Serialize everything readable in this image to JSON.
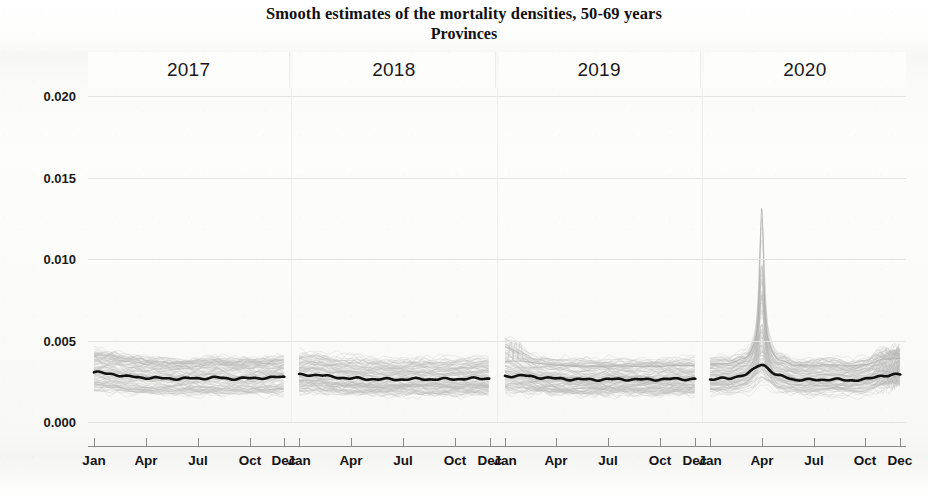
{
  "title": {
    "main": "Smooth estimates of the mortality densities, 50-69 years",
    "sub": "Provinces"
  },
  "chart_data": {
    "type": "line",
    "title": "Smooth estimates of the mortality densities, 50-69 years",
    "subtitle": "Provinces",
    "xlabel": "",
    "ylabel": "",
    "grid": true,
    "legend": false,
    "legend_position": "none",
    "faceted": true,
    "facet_labels": [
      "2017",
      "2018",
      "2019",
      "2020"
    ],
    "ylim": [
      0.0,
      0.0205
    ],
    "ytick_values": [
      0.0,
      0.005,
      0.01,
      0.015,
      0.02
    ],
    "ytick_labels": [
      "0.000",
      "0.005",
      "0.010",
      "0.015",
      "0.020"
    ],
    "xtick_labels": [
      "Jan",
      "Apr",
      "Jul",
      "Oct",
      "Dec"
    ],
    "xtick_months": [
      1,
      4,
      7,
      10,
      12
    ],
    "colors": {
      "mean_line": "#111111",
      "province_lines": "#b9b9b9",
      "gridline": "#e3e3e2",
      "axis": "#8b8b8b",
      "background": "#fbfbfa"
    },
    "series_description": "One faint grey curve per province plus a bold black overall mean curve, per calendar year panel.",
    "n_provinces": 107,
    "series": [
      {
        "name": "Mean (all provinces) 2017",
        "facet": "2017",
        "color": "#111111",
        "x": [
          1,
          2,
          3,
          4,
          5,
          6,
          7,
          8,
          9,
          10,
          11,
          12
        ],
        "values": [
          0.00305,
          0.00295,
          0.00278,
          0.00272,
          0.00268,
          0.00266,
          0.00268,
          0.00272,
          0.00266,
          0.00268,
          0.00272,
          0.00276
        ]
      },
      {
        "name": "Mean (all provinces) 2018",
        "facet": "2018",
        "color": "#111111",
        "x": [
          1,
          2,
          3,
          4,
          5,
          6,
          7,
          8,
          9,
          10,
          11,
          12
        ],
        "values": [
          0.00288,
          0.0029,
          0.00276,
          0.00268,
          0.00264,
          0.00262,
          0.00262,
          0.00264,
          0.00262,
          0.00264,
          0.00266,
          0.00268
        ]
      },
      {
        "name": "Mean (all provinces) 2019",
        "facet": "2019",
        "color": "#111111",
        "x": [
          1,
          2,
          3,
          4,
          5,
          6,
          7,
          8,
          9,
          10,
          11,
          12
        ],
        "values": [
          0.00282,
          0.00284,
          0.00274,
          0.00266,
          0.00262,
          0.0026,
          0.00262,
          0.00262,
          0.0026,
          0.00262,
          0.00264,
          0.00264
        ]
      },
      {
        "name": "Mean (all provinces) 2020",
        "facet": "2020",
        "color": "#111111",
        "x": [
          1,
          2,
          3,
          4,
          5,
          6,
          7,
          8,
          9,
          10,
          11,
          12
        ],
        "values": [
          0.00264,
          0.00266,
          0.0029,
          0.00352,
          0.00282,
          0.0026,
          0.00258,
          0.00262,
          0.00256,
          0.00262,
          0.00286,
          0.0029
        ]
      },
      {
        "name": "Province envelope upper 2017",
        "facet": "2017",
        "color": "#b9b9b9",
        "x": [
          1,
          2,
          3,
          4,
          5,
          6,
          7,
          8,
          9,
          10,
          11,
          12
        ],
        "values": [
          0.0042,
          0.00415,
          0.004,
          0.00392,
          0.00385,
          0.0038,
          0.00382,
          0.00395,
          0.00382,
          0.00388,
          0.00398,
          0.00405
        ]
      },
      {
        "name": "Province envelope lower 2017",
        "facet": "2017",
        "color": "#b9b9b9",
        "x": [
          1,
          2,
          3,
          4,
          5,
          6,
          7,
          8,
          9,
          10,
          11,
          12
        ],
        "values": [
          0.0019,
          0.00185,
          0.00175,
          0.0017,
          0.00168,
          0.00166,
          0.00166,
          0.00168,
          0.00166,
          0.00168,
          0.00172,
          0.00176
        ]
      },
      {
        "name": "Province envelope upper 2020",
        "facet": "2020",
        "color": "#b9b9b9",
        "x": [
          1,
          2,
          3,
          4,
          5,
          6,
          7,
          8,
          9,
          10,
          11,
          12
        ],
        "values": [
          0.004,
          0.0041,
          0.0052,
          0.0098,
          0.0047,
          0.0039,
          0.00382,
          0.00388,
          0.0038,
          0.00396,
          0.0047,
          0.0047
        ]
      },
      {
        "name": "Province envelope lower 2020",
        "facet": "2020",
        "color": "#b9b9b9",
        "x": [
          1,
          2,
          3,
          4,
          5,
          6,
          7,
          8,
          9,
          10,
          11,
          12
        ],
        "values": [
          0.0016,
          0.00162,
          0.0017,
          0.00195,
          0.00172,
          0.0016,
          0.00158,
          0.0016,
          0.00156,
          0.0016,
          0.00172,
          0.00176
        ]
      }
    ],
    "annotations": [
      {
        "facet": "2020",
        "month": 4,
        "text": "COVID-19 peak; highest province curve reaches about 0.0098"
      }
    ]
  },
  "axes": {
    "y_labels": [
      "0.020",
      "0.015",
      "0.010",
      "0.005",
      "0.000"
    ],
    "y_values": [
      0.02,
      0.015,
      0.01,
      0.005,
      0.0
    ],
    "x_labels_per_panel": [
      "Jan",
      "Apr",
      "Jul",
      "Oct",
      "Dec"
    ]
  },
  "strips": [
    {
      "label": "2017"
    },
    {
      "label": "2018"
    },
    {
      "label": "2019"
    },
    {
      "label": "2020"
    }
  ]
}
